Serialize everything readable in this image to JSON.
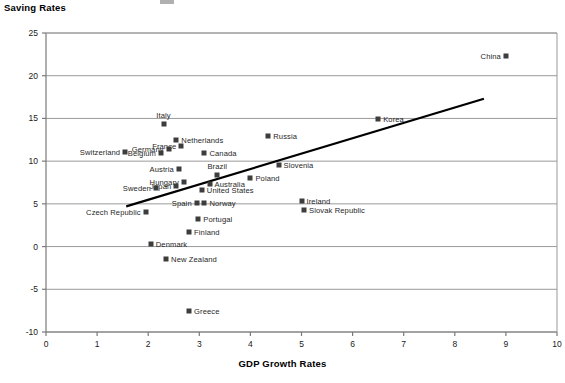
{
  "chart_data": {
    "type": "scatter",
    "title": "",
    "ylabel": "Saving Rates",
    "xlabel": "GDP Growth Rates",
    "xlim": [
      0,
      10
    ],
    "ylim": [
      -10,
      25
    ],
    "xticks": [
      "0",
      "1",
      "2",
      "3",
      "4",
      "5",
      "6",
      "7",
      "8",
      "9",
      "10"
    ],
    "yticks": [
      "25",
      "20",
      "15",
      "10",
      "5",
      "0",
      "-5",
      "-10"
    ],
    "grid": "horizontal",
    "legend": "none",
    "marker_color": "#3d3d3d",
    "trendline": {
      "type": "linear",
      "x_start": 1.57,
      "y_start": 4.7,
      "x_end": 8.57,
      "y_end": 17.3
    },
    "points": [
      {
        "name": "China",
        "x": 9.0,
        "y": 22.3,
        "label_side": "left"
      },
      {
        "name": "Korea",
        "x": 6.5,
        "y": 14.9,
        "label_side": "right"
      },
      {
        "name": "Italy",
        "x": 2.3,
        "y": 14.3,
        "label_side": "above"
      },
      {
        "name": "Russia",
        "x": 4.35,
        "y": 12.9,
        "label_side": "right"
      },
      {
        "name": "Netherlands",
        "x": 2.55,
        "y": 12.5,
        "label_side": "right"
      },
      {
        "name": "France",
        "x": 2.65,
        "y": 11.8,
        "label_side": "left"
      },
      {
        "name": "Germany",
        "x": 2.4,
        "y": 11.4,
        "label_side": "left"
      },
      {
        "name": "Switzerland",
        "x": 1.55,
        "y": 11.1,
        "label_side": "left"
      },
      {
        "name": "Belgium",
        "x": 2.25,
        "y": 11.0,
        "label_side": "left"
      },
      {
        "name": "Canada",
        "x": 3.1,
        "y": 11.0,
        "label_side": "right"
      },
      {
        "name": "Slovenia",
        "x": 4.55,
        "y": 9.6,
        "label_side": "right"
      },
      {
        "name": "Austria",
        "x": 2.6,
        "y": 9.1,
        "label_side": "left"
      },
      {
        "name": "Brazil",
        "x": 3.35,
        "y": 8.4,
        "label_side": "above"
      },
      {
        "name": "Poland",
        "x": 4.0,
        "y": 8.0,
        "label_side": "right"
      },
      {
        "name": "Hungary",
        "x": 2.7,
        "y": 7.6,
        "label_side": "left"
      },
      {
        "name": "Australia",
        "x": 3.2,
        "y": 7.3,
        "label_side": "right"
      },
      {
        "name": "Japan",
        "x": 2.55,
        "y": 7.1,
        "label_side": "left"
      },
      {
        "name": "Sweden",
        "x": 2.15,
        "y": 6.9,
        "label_side": "left"
      },
      {
        "name": "United States",
        "x": 3.05,
        "y": 6.6,
        "label_side": "right"
      },
      {
        "name": "Ireland",
        "x": 5.0,
        "y": 5.3,
        "label_side": "right"
      },
      {
        "name": "Spain",
        "x": 2.95,
        "y": 5.1,
        "label_side": "left"
      },
      {
        "name": "Norway",
        "x": 3.1,
        "y": 5.1,
        "label_side": "right"
      },
      {
        "name": "Slovak Republic",
        "x": 5.05,
        "y": 4.3,
        "label_side": "right"
      },
      {
        "name": "Czech Republic",
        "x": 1.95,
        "y": 4.0,
        "label_side": "left"
      },
      {
        "name": "Portugal",
        "x": 2.98,
        "y": 3.2,
        "label_side": "right"
      },
      {
        "name": "Finland",
        "x": 2.8,
        "y": 1.7,
        "label_side": "right"
      },
      {
        "name": "Denmark",
        "x": 2.05,
        "y": 0.3,
        "label_side": "right"
      },
      {
        "name": "New Zealand",
        "x": 2.35,
        "y": -1.4,
        "label_side": "right"
      },
      {
        "name": "Greece",
        "x": 2.8,
        "y": -7.5,
        "label_side": "right"
      }
    ]
  }
}
